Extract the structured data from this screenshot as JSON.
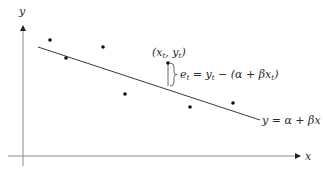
{
  "diagram": {
    "type": "regression-residual-illustration",
    "axes": {
      "x_label": "x",
      "y_label": "y"
    },
    "regression_line": {
      "label": "y = α + βx",
      "from": [
        38,
        47
      ],
      "to": [
        260,
        120
      ]
    },
    "points": [
      [
        50,
        40
      ],
      [
        66,
        58
      ],
      [
        103,
        47
      ],
      [
        125,
        94
      ],
      [
        168,
        63
      ],
      [
        190,
        107
      ],
      [
        233,
        103
      ]
    ],
    "highlighted_point": {
      "label": "(x_t, y_t)",
      "label_parts": {
        "open": "(x",
        "sub1": "t",
        "mid": ", y",
        "sub2": "t",
        "close": ")"
      }
    },
    "residual": {
      "label_parts": {
        "e": "e",
        "e_sub": "t",
        "eq": " = y",
        "y_sub": "t",
        "rest": " − (α + βx",
        "x_sub": "t",
        "close": ")"
      }
    },
    "colors": {
      "axis": "#8a8a8a",
      "line": "#3a3a3a",
      "point": "#111111",
      "text": "#2a2a2a"
    }
  }
}
